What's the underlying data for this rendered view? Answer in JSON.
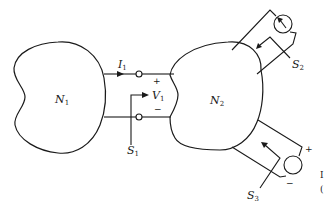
{
  "diagram": {
    "networks": [
      {
        "id": "N1",
        "label": "N",
        "subscript": "1"
      },
      {
        "id": "N2",
        "label": "N",
        "subscript": "2"
      }
    ],
    "port1": {
      "current": {
        "label": "I",
        "subscript": "1"
      },
      "voltage": {
        "label": "V",
        "subscript": "1",
        "plus": "+",
        "minus": "−"
      },
      "cut_surface": {
        "label": "S",
        "subscript": "1"
      }
    },
    "port2": {
      "source": "current-source",
      "cut_surface": {
        "label": "S",
        "subscript": "2"
      }
    },
    "port3": {
      "source": "voltage-source",
      "plus": "+",
      "minus": "−",
      "cut_surface": {
        "label": "S",
        "subscript": "3"
      }
    },
    "margin_fragments": [
      "I",
      "("
    ]
  }
}
